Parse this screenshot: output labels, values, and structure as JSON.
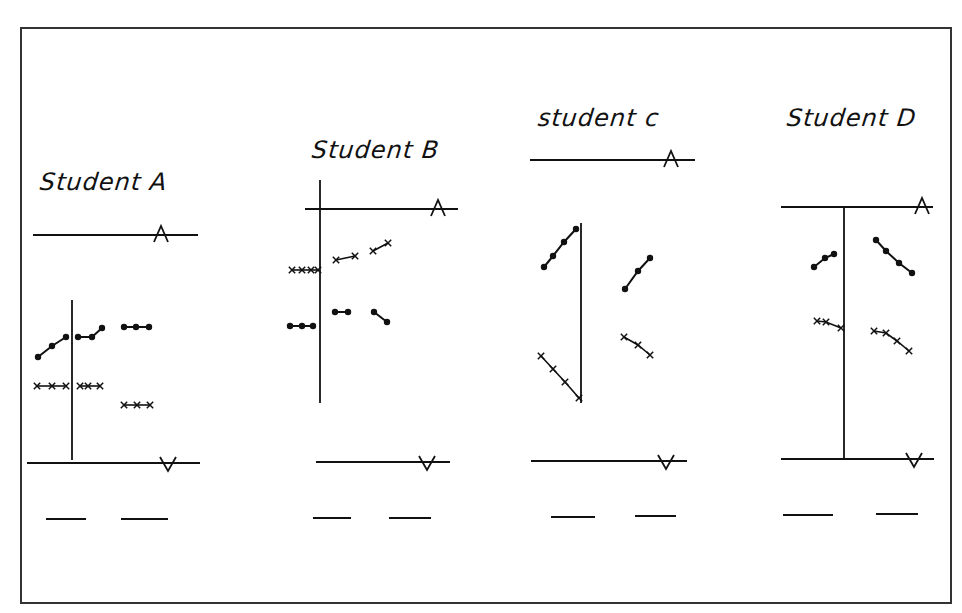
{
  "figure": {
    "border": {
      "x1": 21,
      "y1": 28,
      "x2": 951,
      "y2": 603
    },
    "ink_color": "#111111",
    "background": "#ffffff"
  },
  "panels": [
    {
      "id": "A",
      "title": "Student A",
      "title_pos": {
        "x": 40,
        "y": 172
      },
      "top_line": {
        "x1": 33,
        "y1": 235,
        "x2": 198,
        "y2": 235,
        "marker": "A",
        "marker_x": 161
      },
      "bottom_line": {
        "x1": 27,
        "y1": 463,
        "x2": 200,
        "y2": 463,
        "marker": "V",
        "marker_x": 168
      },
      "axis": {
        "x": 72,
        "y1": 300,
        "y2": 460
      },
      "dash_lines": [
        {
          "x1": 46,
          "y1": 519,
          "x2": 86,
          "y2": 519
        },
        {
          "x1": 121,
          "y1": 519,
          "x2": 168,
          "y2": 519
        }
      ],
      "dot_series": [
        [
          [
            38,
            357
          ],
          [
            52,
            346
          ],
          [
            66,
            337
          ]
        ],
        [
          [
            78,
            337
          ],
          [
            92,
            337
          ],
          [
            102,
            328
          ]
        ],
        [
          [
            124,
            327
          ],
          [
            136,
            327
          ],
          [
            149,
            327
          ]
        ]
      ],
      "cross_series": [
        [
          [
            37,
            386
          ],
          [
            52,
            386
          ],
          [
            66,
            386
          ]
        ],
        [
          [
            80,
            386
          ],
          [
            88,
            386
          ],
          [
            100,
            386
          ]
        ],
        [
          [
            124,
            405
          ],
          [
            137,
            405
          ],
          [
            150,
            405
          ]
        ]
      ]
    },
    {
      "id": "B",
      "title": "Student B",
      "title_pos": {
        "x": 312,
        "y": 140
      },
      "top_line": {
        "x1": 305,
        "y1": 209,
        "x2": 458,
        "y2": 209,
        "marker": "A",
        "marker_x": 438
      },
      "bottom_line": {
        "x1": 316,
        "y1": 462,
        "x2": 450,
        "y2": 462,
        "marker": "V",
        "marker_x": 427
      },
      "axis": {
        "x": 320,
        "y1": 180,
        "y2": 403
      },
      "dash_lines": [
        {
          "x1": 313,
          "y1": 518,
          "x2": 351,
          "y2": 518
        },
        {
          "x1": 389,
          "y1": 518,
          "x2": 431,
          "y2": 518
        }
      ],
      "dot_series": [
        [
          [
            290,
            326
          ],
          [
            302,
            326
          ],
          [
            313,
            326
          ]
        ],
        [
          [
            335,
            312
          ],
          [
            348,
            312
          ]
        ],
        [
          [
            374,
            312
          ],
          [
            387,
            322
          ]
        ]
      ],
      "cross_series": [
        [
          [
            292,
            270
          ],
          [
            302,
            270
          ],
          [
            311,
            270
          ],
          [
            318,
            270
          ]
        ],
        [
          [
            336,
            260
          ],
          [
            355,
            256
          ]
        ],
        [
          [
            373,
            251
          ],
          [
            388,
            243
          ]
        ]
      ]
    },
    {
      "id": "C",
      "title": "student c",
      "title_pos": {
        "x": 538,
        "y": 108
      },
      "top_line": {
        "x1": 530,
        "y1": 160,
        "x2": 695,
        "y2": 160,
        "marker": "A",
        "marker_x": 671
      },
      "bottom_line": {
        "x1": 531,
        "y1": 461,
        "x2": 687,
        "y2": 461,
        "marker": "V",
        "marker_x": 666
      },
      "axis": {
        "x": 581,
        "y1": 223,
        "y2": 403
      },
      "dash_lines": [
        {
          "x1": 551,
          "y1": 517,
          "x2": 595,
          "y2": 517
        },
        {
          "x1": 635,
          "y1": 516,
          "x2": 676,
          "y2": 516
        }
      ],
      "dot_series": [
        [
          [
            544,
            267
          ],
          [
            553,
            256
          ],
          [
            564,
            242
          ],
          [
            576,
            229
          ]
        ],
        [
          [
            625,
            289
          ],
          [
            638,
            271
          ],
          [
            650,
            258
          ]
        ]
      ],
      "cross_series": [
        [
          [
            541,
            356
          ],
          [
            553,
            369
          ],
          [
            565,
            382
          ],
          [
            579,
            398
          ]
        ],
        [
          [
            624,
            337
          ],
          [
            638,
            345
          ],
          [
            650,
            355
          ]
        ]
      ]
    },
    {
      "id": "D",
      "title": "Student D",
      "title_pos": {
        "x": 787,
        "y": 108
      },
      "top_line": {
        "x1": 781,
        "y1": 207,
        "x2": 933,
        "y2": 207,
        "marker": "A",
        "marker_x": 922
      },
      "bottom_line": {
        "x1": 781,
        "y1": 459,
        "x2": 934,
        "y2": 459,
        "marker": "V",
        "marker_x": 914
      },
      "axis": {
        "x": 844,
        "y1": 207,
        "y2": 459
      },
      "dash_lines": [
        {
          "x1": 783,
          "y1": 515,
          "x2": 833,
          "y2": 515
        },
        {
          "x1": 876,
          "y1": 514,
          "x2": 918,
          "y2": 514
        }
      ],
      "dot_series": [
        [
          [
            814,
            267
          ],
          [
            825,
            258
          ],
          [
            834,
            254
          ]
        ],
        [
          [
            876,
            240
          ],
          [
            886,
            251
          ],
          [
            899,
            263
          ],
          [
            912,
            273
          ]
        ]
      ],
      "cross_series": [
        [
          [
            817,
            321
          ],
          [
            826,
            322
          ],
          [
            841,
            328
          ]
        ],
        [
          [
            874,
            331
          ],
          [
            886,
            333
          ],
          [
            897,
            341
          ],
          [
            909,
            351
          ]
        ]
      ]
    }
  ]
}
